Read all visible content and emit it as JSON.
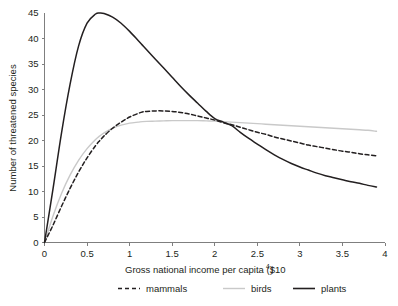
{
  "chart_data": {
    "type": "line",
    "title": "",
    "xlabel": "Gross national income per capita ($10",
    "xlabel_sup": "4",
    "xlabel_tail": ")",
    "ylabel": "Number of threatened species",
    "xlim": [
      0,
      4
    ],
    "ylim": [
      0,
      45
    ],
    "grid": false,
    "legend_position": "below",
    "xticks": [
      "0",
      "0.5",
      "1",
      "1.5",
      "2",
      "2.5",
      "3",
      "3.5",
      "4"
    ],
    "xtick_values": [
      0,
      0.5,
      1,
      1.5,
      2,
      2.5,
      3,
      3.5,
      4
    ],
    "yticks": [
      "0",
      "5",
      "10",
      "15",
      "20",
      "25",
      "30",
      "35",
      "40",
      "45"
    ],
    "ytick_values": [
      0,
      5,
      10,
      15,
      20,
      25,
      30,
      35,
      40,
      45
    ],
    "x": [
      0,
      0.1,
      0.2,
      0.3,
      0.4,
      0.5,
      0.6,
      0.65,
      0.7,
      0.8,
      0.9,
      1.0,
      1.1,
      1.15,
      1.2,
      1.3,
      1.4,
      1.5,
      1.6,
      1.7,
      1.8,
      1.9,
      2.0,
      2.1,
      2.2,
      2.3,
      2.4,
      2.5,
      2.6,
      2.7,
      2.8,
      2.9,
      3.0,
      3.1,
      3.2,
      3.3,
      3.4,
      3.5,
      3.6,
      3.7,
      3.8,
      3.9
    ],
    "series": [
      {
        "name": "mammals",
        "color": "#231f20",
        "style": "dashed",
        "values": [
          0,
          3.4,
          7.1,
          10.6,
          13.8,
          16.6,
          19.0,
          20.0,
          20.9,
          22.4,
          23.6,
          24.6,
          25.3,
          25.6,
          25.7,
          25.8,
          25.8,
          25.7,
          25.5,
          25.2,
          24.8,
          24.4,
          24.0,
          23.5,
          23.1,
          22.6,
          22.1,
          21.6,
          21.2,
          20.7,
          20.3,
          19.9,
          19.5,
          19.1,
          18.8,
          18.5,
          18.2,
          17.9,
          17.7,
          17.4,
          17.2,
          17.0
        ]
      },
      {
        "name": "birds",
        "color": "#c9c9c9",
        "style": "solid",
        "values": [
          0,
          5.2,
          9.6,
          13.2,
          16.1,
          18.4,
          20.2,
          20.9,
          21.5,
          22.4,
          23.0,
          23.4,
          23.6,
          23.7,
          23.75,
          23.8,
          23.85,
          23.9,
          23.9,
          23.9,
          23.9,
          23.85,
          23.8,
          23.7,
          23.6,
          23.5,
          23.4,
          23.3,
          23.2,
          23.1,
          23.0,
          22.9,
          22.8,
          22.7,
          22.6,
          22.5,
          22.4,
          22.3,
          22.2,
          22.1,
          22.0,
          21.8
        ]
      },
      {
        "name": "plants",
        "color": "#231f20",
        "style": "solid",
        "values": [
          0,
          10.5,
          21.5,
          31.0,
          38.5,
          43.0,
          44.8,
          45.0,
          44.9,
          44.2,
          43.0,
          41.4,
          39.6,
          38.7,
          37.8,
          36.0,
          34.2,
          32.4,
          30.6,
          28.9,
          27.3,
          25.7,
          24.3,
          23.6,
          22.9,
          21.6,
          20.4,
          19.3,
          18.2,
          17.2,
          16.3,
          15.5,
          14.8,
          14.2,
          13.6,
          13.1,
          12.7,
          12.3,
          11.9,
          11.6,
          11.2,
          10.9
        ]
      }
    ],
    "annotations": {
      "peak_plants": {
        "x": 0.65,
        "y": 45
      },
      "peak_mammals": {
        "x": 1.25,
        "y": 25.8
      },
      "plateau_birds": {
        "x": 1.6,
        "y": 23.9
      },
      "crossing": {
        "x": 2.2,
        "y": 23.0
      }
    }
  },
  "legend": {
    "items": [
      {
        "label": "mammals",
        "color": "#231f20",
        "style": "dashed"
      },
      {
        "label": "birds",
        "color": "#c9c9c9",
        "style": "solid"
      },
      {
        "label": "plants",
        "color": "#231f20",
        "style": "solid"
      }
    ]
  }
}
